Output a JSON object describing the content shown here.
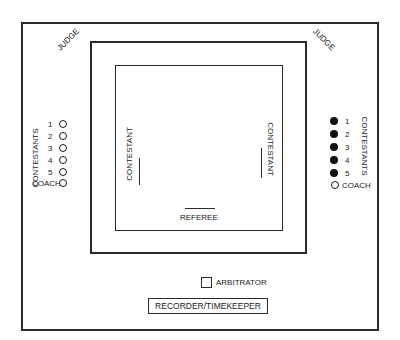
{
  "diagram": {
    "title": "",
    "labels": {
      "judge_left": "JUDGE",
      "judge_right": "JUDGE",
      "contestant_left": "CONTESTANT",
      "contestant_right": "CONTESTANT",
      "referee": "REFEREE",
      "arbitrator": "ARBITRATOR",
      "recorder": "RECORDER/TIMEKEEPER"
    },
    "left_team": {
      "group_label": "CONTESTANTS",
      "marker": "open-circle",
      "members": [
        "1",
        "2",
        "3",
        "4",
        "5"
      ],
      "coach_label": "COACH",
      "coach_marker": "open-circle"
    },
    "right_team": {
      "group_label": "CONTESTANTS",
      "marker": "filled-circle",
      "members": [
        "1",
        "2",
        "3",
        "4",
        "5"
      ],
      "coach_label": "COACH",
      "coach_marker": "open-circle"
    },
    "colors": {
      "line": "#2a2a2a",
      "background": "#ffffff",
      "filled_marker": "#111111"
    }
  }
}
